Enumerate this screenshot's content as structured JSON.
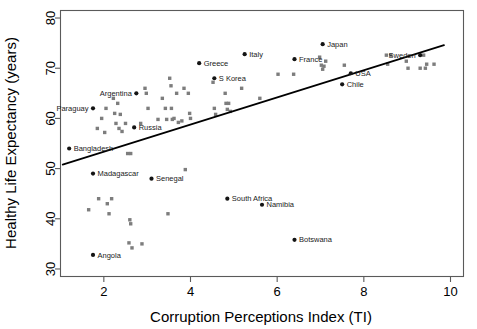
{
  "chart_data": {
    "type": "scatter",
    "title": "",
    "xlabel": "Corruption Perceptions Index (TI)",
    "ylabel": "Healthy Life Expectancy (years)",
    "xlim": [
      1.0,
      10.3
    ],
    "ylim": [
      28.5,
      81.5
    ],
    "xticks": [
      2,
      4,
      6,
      8,
      10
    ],
    "yticks": [
      30,
      40,
      50,
      60,
      70,
      80
    ],
    "grid": false,
    "legend": "none",
    "point_color_unlabeled": "#7d7d7d",
    "point_color_labeled": "#141414",
    "trendline": {
      "type": "linear",
      "x_start": 1.05,
      "y_start": 50.8,
      "x_end": 9.85,
      "y_end": 74.6,
      "color": "#000000"
    },
    "labeled_points": [
      {
        "label": "Paraguay",
        "x": 1.75,
        "y": 62.0,
        "label_pos": "left"
      },
      {
        "label": "Bangladesh",
        "x": 1.2,
        "y": 54.0,
        "label_pos": "right"
      },
      {
        "label": "Argentina",
        "x": 2.75,
        "y": 65.0,
        "label_pos": "left"
      },
      {
        "label": "Russia",
        "x": 2.7,
        "y": 58.2,
        "label_pos": "right"
      },
      {
        "label": "Madagascar",
        "x": 1.75,
        "y": 49.0,
        "label_pos": "right"
      },
      {
        "label": "Angola",
        "x": 1.75,
        "y": 32.8,
        "label_pos": "right"
      },
      {
        "label": "Senegal",
        "x": 3.1,
        "y": 48.0,
        "label_pos": "right"
      },
      {
        "label": "Greece",
        "x": 4.2,
        "y": 71.0,
        "label_pos": "right"
      },
      {
        "label": "S Korea",
        "x": 4.55,
        "y": 68.0,
        "label_pos": "right"
      },
      {
        "label": "Italy",
        "x": 5.25,
        "y": 72.8,
        "label_pos": "right"
      },
      {
        "label": "France",
        "x": 6.4,
        "y": 71.8,
        "label_pos": "right"
      },
      {
        "label": "Japan",
        "x": 7.05,
        "y": 74.8,
        "label_pos": "right"
      },
      {
        "label": "Sweden",
        "x": 9.3,
        "y": 72.6,
        "label_pos": "left"
      },
      {
        "label": "USA",
        "x": 7.7,
        "y": 69.0,
        "label_pos": "right"
      },
      {
        "label": "Chile",
        "x": 7.5,
        "y": 66.8,
        "label_pos": "right"
      },
      {
        "label": "South Africa",
        "x": 4.85,
        "y": 44.0,
        "label_pos": "right"
      },
      {
        "label": "Namibia",
        "x": 5.65,
        "y": 42.8,
        "label_pos": "right"
      },
      {
        "label": "Botswana",
        "x": 6.4,
        "y": 35.8,
        "label_pos": "right"
      }
    ],
    "unlabeled_points": [
      {
        "x": 1.65,
        "y": 41.8
      },
      {
        "x": 1.85,
        "y": 58.0
      },
      {
        "x": 1.88,
        "y": 44.0
      },
      {
        "x": 1.95,
        "y": 60.0
      },
      {
        "x": 2.02,
        "y": 57.2
      },
      {
        "x": 2.05,
        "y": 62.0
      },
      {
        "x": 2.08,
        "y": 43.0
      },
      {
        "x": 2.12,
        "y": 41.0
      },
      {
        "x": 2.18,
        "y": 44.0
      },
      {
        "x": 2.22,
        "y": 64.0
      },
      {
        "x": 2.25,
        "y": 61.0
      },
      {
        "x": 2.28,
        "y": 59.0
      },
      {
        "x": 2.32,
        "y": 63.0
      },
      {
        "x": 2.35,
        "y": 58.0
      },
      {
        "x": 2.38,
        "y": 60.8
      },
      {
        "x": 2.42,
        "y": 57.4
      },
      {
        "x": 2.5,
        "y": 59.0
      },
      {
        "x": 2.55,
        "y": 53.0
      },
      {
        "x": 2.62,
        "y": 53.0
      },
      {
        "x": 2.6,
        "y": 39.8
      },
      {
        "x": 2.62,
        "y": 39.0
      },
      {
        "x": 2.58,
        "y": 35.2
      },
      {
        "x": 2.65,
        "y": 34.2
      },
      {
        "x": 2.85,
        "y": 59.0
      },
      {
        "x": 2.88,
        "y": 35.0
      },
      {
        "x": 2.95,
        "y": 66.0
      },
      {
        "x": 2.98,
        "y": 65.0
      },
      {
        "x": 3.02,
        "y": 62.0
      },
      {
        "x": 3.25,
        "y": 59.8
      },
      {
        "x": 3.35,
        "y": 64.0
      },
      {
        "x": 3.42,
        "y": 62.0
      },
      {
        "x": 3.45,
        "y": 59.8
      },
      {
        "x": 3.48,
        "y": 41.0
      },
      {
        "x": 3.52,
        "y": 68.0
      },
      {
        "x": 3.55,
        "y": 66.5
      },
      {
        "x": 3.56,
        "y": 62.0
      },
      {
        "x": 3.58,
        "y": 59.8
      },
      {
        "x": 3.62,
        "y": 60.0
      },
      {
        "x": 3.68,
        "y": 65.0
      },
      {
        "x": 3.72,
        "y": 59.2
      },
      {
        "x": 3.8,
        "y": 59.5
      },
      {
        "x": 3.85,
        "y": 66.0
      },
      {
        "x": 3.88,
        "y": 49.8
      },
      {
        "x": 3.95,
        "y": 65.0
      },
      {
        "x": 3.98,
        "y": 61.0
      },
      {
        "x": 4.0,
        "y": 60.0
      },
      {
        "x": 4.52,
        "y": 67.2
      },
      {
        "x": 4.55,
        "y": 62.0
      },
      {
        "x": 4.58,
        "y": 60.8
      },
      {
        "x": 4.8,
        "y": 65.0
      },
      {
        "x": 4.82,
        "y": 63.0
      },
      {
        "x": 4.88,
        "y": 63.0
      },
      {
        "x": 4.85,
        "y": 61.8
      },
      {
        "x": 4.92,
        "y": 61.4
      },
      {
        "x": 5.18,
        "y": 66.0
      },
      {
        "x": 5.6,
        "y": 64.0
      },
      {
        "x": 6.02,
        "y": 68.8
      },
      {
        "x": 6.38,
        "y": 68.8
      },
      {
        "x": 6.98,
        "y": 72.2
      },
      {
        "x": 7.02,
        "y": 70.6
      },
      {
        "x": 7.05,
        "y": 69.8
      },
      {
        "x": 7.12,
        "y": 71.4
      },
      {
        "x": 7.08,
        "y": 70.4
      },
      {
        "x": 7.55,
        "y": 70.6
      },
      {
        "x": 8.52,
        "y": 72.6
      },
      {
        "x": 8.62,
        "y": 72.6
      },
      {
        "x": 8.55,
        "y": 70.8
      },
      {
        "x": 8.98,
        "y": 71.4
      },
      {
        "x": 9.02,
        "y": 70.0
      },
      {
        "x": 9.38,
        "y": 72.6
      },
      {
        "x": 9.3,
        "y": 70.0
      },
      {
        "x": 9.42,
        "y": 70.0
      },
      {
        "x": 9.45,
        "y": 70.8
      },
      {
        "x": 9.62,
        "y": 70.8
      }
    ]
  }
}
